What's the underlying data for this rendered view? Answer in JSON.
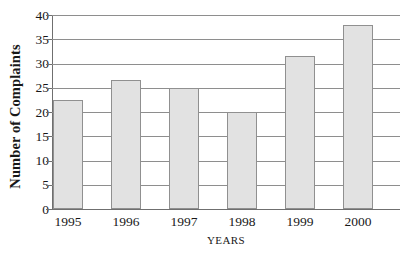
{
  "chart_data": {
    "type": "bar",
    "title": "",
    "subtitle": "",
    "xlabel": "YEARS",
    "ylabel": "Number of Complaints",
    "categories": [
      "1995",
      "1996",
      "1997",
      "1998",
      "1999",
      "2000"
    ],
    "values": [
      22.5,
      26.5,
      25,
      20,
      31.5,
      38
    ],
    "series": [
      {
        "name": "Number of Complaints",
        "values": [
          22.5,
          26.5,
          25,
          20,
          31.5,
          38
        ]
      }
    ],
    "ylim": [
      0,
      40
    ],
    "ytick_labels": [
      "0",
      "5",
      "10",
      "15",
      "20",
      "25",
      "30",
      "35",
      "40"
    ],
    "ytick_values": [
      0,
      5,
      10,
      15,
      20,
      25,
      30,
      35,
      40
    ],
    "grid": "horizontal",
    "legend": "none",
    "bar_fill_color": "#e2e2e2",
    "bar_border_color": "#909090",
    "axis_color": "#6f6f6f",
    "gridline_color": "#8e8e8e",
    "background_color": "#ffffff"
  }
}
